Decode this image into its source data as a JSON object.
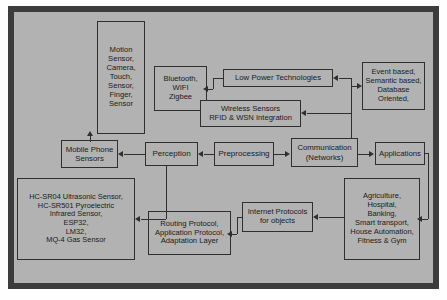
{
  "diagram": {
    "background_color": "#b2b2b2",
    "frame_color": "#3c3c3c",
    "line_color": "#2f2f2f",
    "nodes": {
      "motion_sensors": "Motion Sensor, Camera, Touch, Sensor, Finger, Sensor",
      "bluetooth": "Bluetooth, WIFI Zigbee",
      "low_power": "Low Power Technologies",
      "wireless_sensors": "Wireless Sensors RFID & WSN Integration",
      "event_based": "Event based, Semantic based, Database Oriented,",
      "mobile_phone_sensors": "Mobile Phone Sensors",
      "perception": "Perception",
      "preprocessing": "Preprocessing",
      "communication": "Communication (Networks)",
      "applications": "Applications",
      "hardware_sensors": "HC-SR04 Ultrasonic Sensor, HC-SR501 Pyroelectric Infrared Sensor, ESP32, LM32, MQ-4 Gas Sensor",
      "routing_protocol": "Routing Protocol, Application Protocol, Adaptation Layer",
      "internet_protocols": "Internet Protocols for objects",
      "domains": "Agriculture, Hospital, Banking, Smart transport, House Automation, Fitness & Gym"
    },
    "node_lines": {
      "motion_sensors": [
        "Motion",
        "Sensor,",
        "Camera,",
        "Touch,",
        "Sensor,",
        "Finger,",
        "Sensor"
      ],
      "bluetooth": [
        "Bluetooth,",
        "WIFI",
        "Zigbee"
      ],
      "low_power": [
        "Low Power Technologies"
      ],
      "wireless_sensors": [
        "Wireless Sensors",
        "RFID & WSN Integration"
      ],
      "event_based": [
        "Event based,",
        "Semantic based,",
        "Database",
        "Oriented,"
      ],
      "mobile_phone_sensors": [
        "Mobile Phone",
        "Sensors"
      ],
      "perception": [
        "Perception"
      ],
      "preprocessing": [
        "Preprocessing"
      ],
      "communication": [
        "Communication",
        "(Networks)"
      ],
      "applications": [
        "Applications"
      ],
      "hardware_sensors": [
        "HC-SR04 Ultrasonic Sensor,",
        "HC-SR501 Pyroelectric",
        "Infrared Sensor,",
        "ESP32,",
        "LM32,",
        "MQ-4 Gas Sensor"
      ],
      "routing_protocol": [
        "Routing Protocol,",
        "Application Protocol,",
        "Adaptation Layer"
      ],
      "internet_protocols": [
        "Internet Protocols",
        "for objects"
      ],
      "domains": [
        "Agriculture,",
        "Hospital,",
        "Banking,",
        "Smart transport,",
        "House Automation,",
        "Fitness & Gym"
      ]
    }
  }
}
